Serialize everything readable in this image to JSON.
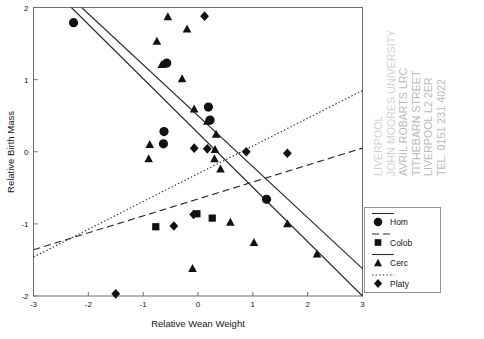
{
  "chart_data": {
    "type": "scatter",
    "title": "",
    "xlabel": "Relative Wean Weight",
    "ylabel": "Relative Birth Mass",
    "xlim": [
      -3,
      3
    ],
    "ylim": [
      -2,
      2
    ],
    "xticks": [
      "-3",
      "-2",
      "-1",
      "0",
      "1",
      "2",
      "3"
    ],
    "xtick_values": [
      -3,
      -2,
      -1,
      0,
      1,
      2,
      3
    ],
    "yticks": [
      "-2",
      "-1",
      "0",
      "1",
      "2"
    ],
    "ytick_values": [
      -2,
      -1,
      0,
      1,
      2
    ],
    "grid": false,
    "legend_position": "right-outside",
    "series": [
      {
        "name": "Hom",
        "marker": "circle",
        "line_style": "solid",
        "points": [
          [
            -2.27,
            1.79
          ],
          [
            -0.57,
            1.23
          ],
          [
            0.19,
            0.62
          ],
          [
            0.22,
            0.44
          ],
          [
            -0.62,
            0.28
          ],
          [
            -0.63,
            0.11
          ],
          [
            1.25,
            -0.66
          ]
        ],
        "fit_line": [
          [
            -3.0,
            2.52
          ],
          [
            3.0,
            -2.0
          ]
        ]
      },
      {
        "name": "Colob",
        "marker": "square",
        "line_style": "dashed",
        "points": [
          [
            -0.02,
            -0.86
          ],
          [
            0.26,
            -0.92
          ],
          [
            -0.77,
            -1.04
          ]
        ],
        "fit_line": [
          [
            -3.0,
            -1.36
          ],
          [
            3.0,
            0.05
          ]
        ]
      },
      {
        "name": "Cerc",
        "marker": "triangle",
        "line_style": "solid",
        "points": [
          [
            -0.55,
            1.87
          ],
          [
            -0.2,
            1.7
          ],
          [
            -0.75,
            1.53
          ],
          [
            -0.66,
            1.21
          ],
          [
            -0.29,
            1.01
          ],
          [
            -0.07,
            0.59
          ],
          [
            0.17,
            0.42
          ],
          [
            0.33,
            0.24
          ],
          [
            0.31,
            0.03
          ],
          [
            0.3,
            -0.1
          ],
          [
            0.41,
            -0.24
          ],
          [
            -0.88,
            0.1
          ],
          [
            -0.9,
            -0.1
          ],
          [
            0.59,
            -0.98
          ],
          [
            1.02,
            -1.26
          ],
          [
            1.63,
            -1.0
          ],
          [
            2.17,
            -1.42
          ],
          [
            -0.1,
            -1.62
          ]
        ],
        "fit_line": [
          [
            -3.0,
            2.62
          ],
          [
            3.0,
            -1.62
          ]
        ]
      },
      {
        "name": "Platy",
        "marker": "diamond",
        "line_style": "dotted",
        "points": [
          [
            0.12,
            1.88
          ],
          [
            0.17,
            0.04
          ],
          [
            -0.07,
            0.05
          ],
          [
            0.88,
            0.0
          ],
          [
            1.63,
            -0.02
          ],
          [
            -0.08,
            -0.87
          ],
          [
            -0.44,
            -1.03
          ],
          [
            -1.5,
            -1.97
          ]
        ],
        "fit_line": [
          [
            -3.0,
            -1.46
          ],
          [
            3.0,
            0.85
          ]
        ]
      }
    ]
  },
  "legend": {
    "entries": [
      {
        "label": "Hom",
        "marker": "circle",
        "line_style": "solid"
      },
      {
        "label": "Colob",
        "marker": "square",
        "line_style": "dashed"
      },
      {
        "label": "Cerc",
        "marker": "triangle",
        "line_style": "solid"
      },
      {
        "label": "Platy",
        "marker": "diamond",
        "line_style": "dotted"
      }
    ]
  },
  "watermark": {
    "lines": [
      "LIVERPOOL",
      "JOHN MOORES UNIVERSITY",
      "AVRIL ROBARTS LRC",
      "TITHEBARN STREET",
      "LIVERPOOL L2 2ER",
      "TEL. 0151 231 4022"
    ]
  },
  "colors": {
    "marker": "#111111",
    "line": "#2b2b2b",
    "axis": "#6e6e6e",
    "watermark": "#b9b9b9"
  }
}
